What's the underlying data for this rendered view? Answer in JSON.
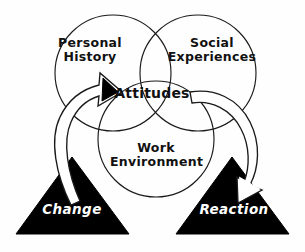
{
  "diagram": {
    "background_color": "#fefefe",
    "line_color": "#1a1a1a",
    "fill_color": "#000000",
    "text_color_on_fill": "#ffffff",
    "circles": [
      {
        "id": "personal-history",
        "label": "Personal\nHistory",
        "label_line_1": "Personal",
        "label_line_2": "History",
        "position": "top-left"
      },
      {
        "id": "social-experiences",
        "label": "Social\nExperiences",
        "label_line_1": "Social",
        "label_line_2": "Experiences",
        "position": "top-right"
      },
      {
        "id": "work-environment",
        "label": "Work\nEnvironment",
        "label_line_1": "Work",
        "label_line_2": "Environment",
        "position": "bottom-center"
      }
    ],
    "center_label": "Attitudes",
    "triangles": [
      {
        "id": "change",
        "label": "Change",
        "position": "bottom-left",
        "fill": "#000000",
        "text_color": "#ffffff"
      },
      {
        "id": "reaction",
        "label": "Reaction",
        "position": "bottom-right",
        "fill": "#000000",
        "text_color": "#ffffff"
      }
    ],
    "arrows": [
      {
        "id": "change-to-attitudes",
        "from": "Change",
        "to": "Attitudes",
        "direction": "up-right",
        "arrowhead_style": "solid-black"
      },
      {
        "id": "attitudes-to-reaction",
        "from": "Attitudes",
        "to": "Reaction",
        "direction": "down-right",
        "arrowhead_style": "hollow-white"
      }
    ]
  }
}
